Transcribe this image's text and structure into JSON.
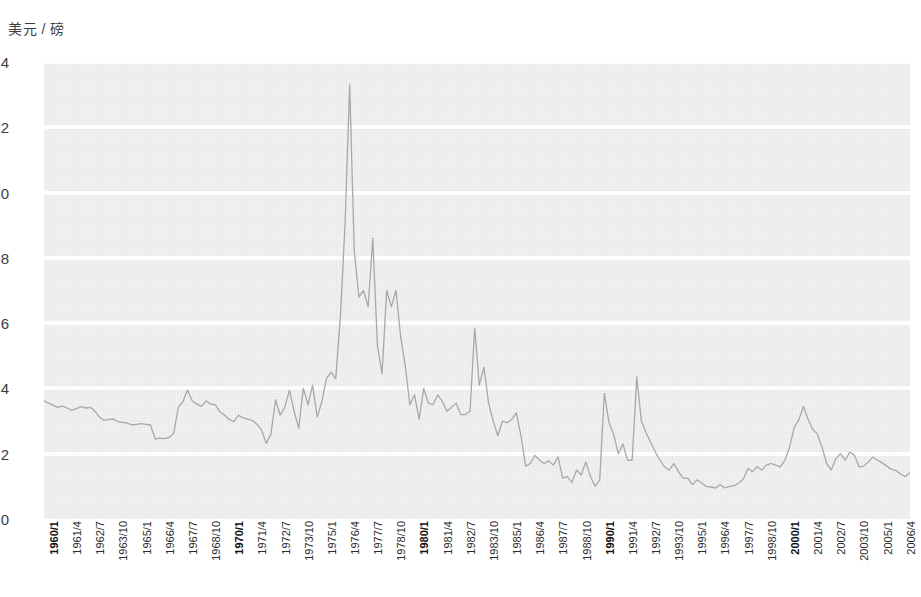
{
  "chart_data": {
    "type": "line",
    "title": "",
    "subtitle": "",
    "ylabel": "美元 / 磅",
    "xlabel": "",
    "ylim": [
      0,
      14
    ],
    "y_ticks": [
      0,
      2,
      4,
      6,
      8,
      10,
      12,
      14
    ],
    "grid": "horizontal-white",
    "legend": "none",
    "background_color": "#ebebeb",
    "line_color": "#a8a8a8",
    "tick_label_color": "#2b2b2b",
    "x_tick_labels": [
      "1960/1",
      "1961/4",
      "1962/7",
      "1963/10",
      "1965/1",
      "1966/4",
      "1967/7",
      "1968/10",
      "1970/1",
      "1971/4",
      "1972/7",
      "1973/10",
      "1975/1",
      "1976/4",
      "1977/7",
      "1978/10",
      "1980/1",
      "1981/4",
      "1982/7",
      "1983/10",
      "1985/1",
      "1986/4",
      "1987/7",
      "1988/10",
      "1990/1",
      "1991/4",
      "1992/7",
      "1993/10",
      "1995/1",
      "1996/4",
      "1997/7",
      "1998/10",
      "2000/1",
      "2001/4",
      "2002/7",
      "2003/10",
      "2005/1",
      "2006/4",
      "2007/7",
      "2008/10",
      "2010/1",
      "2011/4",
      "2012/7",
      "2013/10",
      "2015/1",
      "2016/4",
      "2017/7",
      "2018/10"
    ],
    "x_tick_bold": [
      "1960/1",
      "1970/1",
      "1980/1",
      "1990/1",
      "2000/1",
      "2010/1"
    ],
    "x_tick_step_quarters": 5,
    "x_start": "1960/1",
    "x_end": "2019/4",
    "series": [
      {
        "name": "美元 / 磅",
        "color": "#a8a8a8",
        "values": [
          3.62,
          3.55,
          3.48,
          3.42,
          3.46,
          3.4,
          3.33,
          3.38,
          3.44,
          3.4,
          3.42,
          3.3,
          3.12,
          3.02,
          3.05,
          3.06,
          2.98,
          2.96,
          2.94,
          2.88,
          2.9,
          2.92,
          2.9,
          2.88,
          2.45,
          2.48,
          2.46,
          2.5,
          2.62,
          3.42,
          3.6,
          3.95,
          3.62,
          3.52,
          3.45,
          3.62,
          3.52,
          3.5,
          3.28,
          3.18,
          3.05,
          2.98,
          3.18,
          3.1,
          3.06,
          3.02,
          2.9,
          2.72,
          2.32,
          2.6,
          3.65,
          3.18,
          3.42,
          3.95,
          3.3,
          2.78,
          4.0,
          3.5,
          4.1,
          3.12,
          3.6,
          4.3,
          4.5,
          4.3,
          6.2,
          9.0,
          13.3,
          8.2,
          6.8,
          7.0,
          6.5,
          8.6,
          5.3,
          4.45,
          7.0,
          6.5,
          7.0,
          5.6,
          4.7,
          3.5,
          3.8,
          3.05,
          4.0,
          3.55,
          3.5,
          3.8,
          3.6,
          3.3,
          3.42,
          3.55,
          3.2,
          3.2,
          3.3,
          5.85,
          4.1,
          4.65,
          3.55,
          3.0,
          2.55,
          3.0,
          2.95,
          3.05,
          3.25,
          2.55,
          1.62,
          1.7,
          1.95,
          1.8,
          1.7,
          1.78,
          1.65,
          1.9,
          1.25,
          1.3,
          1.12,
          1.5,
          1.35,
          1.75,
          1.3,
          1.0,
          1.2,
          3.85,
          2.95,
          2.6,
          2.0,
          2.3,
          1.8,
          1.8,
          4.35,
          3.0,
          2.65,
          2.35,
          2.05,
          1.8,
          1.6,
          1.5,
          1.7,
          1.45,
          1.25,
          1.25,
          1.05,
          1.2,
          1.1,
          1.0,
          0.98,
          0.95,
          1.05,
          0.95,
          1.0,
          1.02,
          1.1,
          1.22,
          1.55,
          1.45,
          1.6,
          1.5,
          1.65,
          1.7,
          1.65,
          1.6,
          1.8,
          2.2,
          2.8,
          3.05,
          3.45,
          3.05,
          2.75,
          2.6,
          2.2,
          1.7,
          1.5,
          1.85,
          2.0,
          1.8,
          2.05,
          1.95,
          1.6,
          1.62,
          1.75,
          1.9,
          1.8,
          1.72,
          1.62,
          1.52,
          1.48,
          1.38,
          1.3,
          1.42
        ]
      }
    ]
  }
}
